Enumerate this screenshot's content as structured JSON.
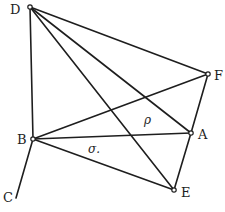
{
  "diagram": {
    "type": "geometric-figure",
    "stroke_color": "#1e1e1e",
    "background": "#ffffff",
    "points": [
      {
        "id": "D",
        "label": "D"
      },
      {
        "id": "F",
        "label": "F"
      },
      {
        "id": "A",
        "label": "A"
      },
      {
        "id": "B",
        "label": "B"
      },
      {
        "id": "E",
        "label": "E"
      },
      {
        "id": "C",
        "label": "C"
      }
    ],
    "edges": [
      [
        "D",
        "B"
      ],
      [
        "D",
        "F"
      ],
      [
        "D",
        "A"
      ],
      [
        "D",
        "E"
      ],
      [
        "B",
        "F"
      ],
      [
        "B",
        "A"
      ],
      [
        "B",
        "E"
      ],
      [
        "F",
        "A"
      ],
      [
        "A",
        "E"
      ],
      [
        "B",
        "C"
      ]
    ],
    "annotations": [
      {
        "id": "rho",
        "text": "ρ"
      },
      {
        "id": "sigma",
        "text": "σ."
      }
    ]
  }
}
